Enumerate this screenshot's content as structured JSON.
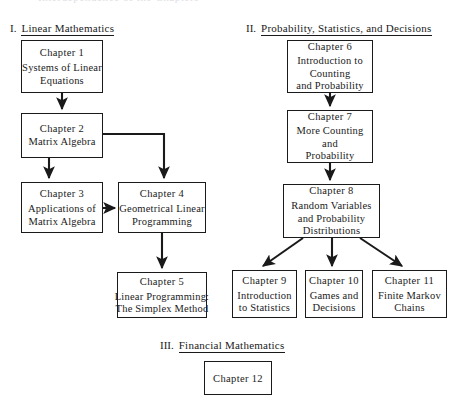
{
  "page": {
    "clipped_top_text": "Interdependence of the Chapters",
    "width": 456,
    "height": 380,
    "ink_color": "#1a1a1a",
    "paper_color": "#ffffff"
  },
  "sections": [
    {
      "numeral": "I.",
      "title": "Linear Mathematics"
    },
    {
      "numeral": "II.",
      "title": "Probability, Statistics, and Decisions"
    },
    {
      "numeral": "III.",
      "title": "Financial Mathematics"
    }
  ],
  "nodes": [
    {
      "id": "ch1",
      "title": "Chapter 1",
      "lines": [
        "Systems of Linear",
        "Equations"
      ]
    },
    {
      "id": "ch2",
      "title": "Chapter 2",
      "lines": [
        "Matrix Algebra"
      ]
    },
    {
      "id": "ch3",
      "title": "Chapter 3",
      "lines": [
        "Applications of",
        "Matrix Algebra"
      ]
    },
    {
      "id": "ch4",
      "title": "Chapter 4",
      "lines": [
        "Geometrical Linear",
        "Programming"
      ]
    },
    {
      "id": "ch5",
      "title": "Chapter 5",
      "lines": [
        "Linear Programming:",
        "The Simplex Method"
      ]
    },
    {
      "id": "ch6",
      "title": "Chapter 6",
      "lines": [
        "Introduction to",
        "Counting",
        "and Probability"
      ]
    },
    {
      "id": "ch7",
      "title": "Chapter 7",
      "lines": [
        "More Counting",
        "and",
        "Probability"
      ]
    },
    {
      "id": "ch8",
      "title": "Chapter 8",
      "lines": [
        "Random Variables",
        "and Probability",
        "Distributions"
      ]
    },
    {
      "id": "ch9",
      "title": "Chapter 9",
      "lines": [
        "Introduction",
        "to Statistics"
      ]
    },
    {
      "id": "ch10",
      "title": "Chapter 10",
      "lines": [
        "Games and",
        "Decisions"
      ]
    },
    {
      "id": "ch11",
      "title": "Chapter 11",
      "lines": [
        "Finite Markov",
        "Chains"
      ]
    },
    {
      "id": "ch12",
      "title": "Chapter 12",
      "lines": []
    }
  ],
  "edges": [
    {
      "from": "ch1",
      "to": "ch2",
      "style": "vertical"
    },
    {
      "from": "ch2",
      "to": "ch3",
      "style": "vertical"
    },
    {
      "from": "ch2",
      "to": "ch4",
      "style": "elbow-right-down"
    },
    {
      "from": "ch3",
      "to": "ch4",
      "style": "horizontal"
    },
    {
      "from": "ch4",
      "to": "ch5",
      "style": "vertical"
    },
    {
      "from": "ch6",
      "to": "ch7",
      "style": "vertical"
    },
    {
      "from": "ch7",
      "to": "ch8",
      "style": "vertical"
    },
    {
      "from": "ch8",
      "to": "ch9",
      "style": "diagonal-left"
    },
    {
      "from": "ch8",
      "to": "ch10",
      "style": "vertical"
    },
    {
      "from": "ch8",
      "to": "ch11",
      "style": "diagonal-right"
    }
  ]
}
